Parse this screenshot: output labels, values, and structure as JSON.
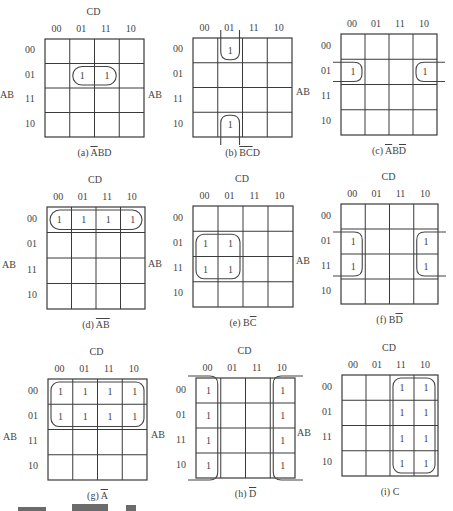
{
  "figure": {
    "row_variable": "AB",
    "col_variable": "CD",
    "gray_codes": [
      "00",
      "01",
      "11",
      "10"
    ],
    "maps": [
      {
        "id": "a",
        "caption_prefix": "(a) ",
        "caption_over": "A",
        "caption_rest": "BD",
        "show_cd": true,
        "grid": [
          45,
          39,
          99,
          98
        ],
        "ones": [
          [
            1,
            1
          ],
          [
            1,
            2
          ]
        ],
        "groups": [
          {
            "type": "rect",
            "rows": [
              1,
              1
            ],
            "cols": [
              1,
              2
            ]
          }
        ]
      },
      {
        "id": "b",
        "caption_prefix": "(b) ",
        "caption_over": "BC",
        "caption_rest": "D",
        "show_cd": false,
        "grid": [
          193,
          38,
          99,
          99
        ],
        "ones": [
          [
            0,
            1
          ],
          [
            3,
            1
          ]
        ],
        "groups": [
          {
            "type": "wrap-vertical",
            "rows": [
              0,
              3
            ],
            "cols": [
              1,
              1
            ]
          }
        ]
      },
      {
        "id": "c",
        "caption_prefix": "(c) ",
        "caption_over": "A",
        "caption_rest": "BD",
        "caption_tail_over": true,
        "show_cd": false,
        "grid": [
          341,
          34,
          96,
          101
        ],
        "ones": [
          [
            1,
            0
          ],
          [
            1,
            3
          ]
        ],
        "groups": [
          {
            "type": "wrap-horizontal",
            "rows": [
              1,
              1
            ],
            "cols": [
              0,
              3
            ]
          }
        ]
      },
      {
        "id": "d",
        "caption_prefix": "(d) ",
        "caption_over": "AB",
        "caption_rest": "",
        "show_cd": true,
        "grid": [
          47,
          207,
          98,
          102
        ],
        "ones": [
          [
            0,
            0
          ],
          [
            0,
            1
          ],
          [
            0,
            2
          ],
          [
            0,
            3
          ]
        ],
        "groups": [
          {
            "type": "rect",
            "rows": [
              0,
              0
            ],
            "cols": [
              0,
              3
            ]
          }
        ]
      },
      {
        "id": "e",
        "caption_prefix": "(e) B",
        "caption_over": "C",
        "caption_rest": "",
        "show_cd": true,
        "grid": [
          193,
          206,
          100,
          101
        ],
        "ones": [
          [
            1,
            0
          ],
          [
            1,
            1
          ],
          [
            2,
            0
          ],
          [
            2,
            1
          ]
        ],
        "groups": [
          {
            "type": "rect",
            "rows": [
              1,
              2
            ],
            "cols": [
              0,
              1
            ]
          }
        ]
      },
      {
        "id": "f",
        "caption_prefix": "(f) B",
        "caption_over": "D",
        "caption_rest": "",
        "show_cd": true,
        "grid": [
          341,
          204,
          97,
          100
        ],
        "ones": [
          [
            1,
            0
          ],
          [
            2,
            0
          ],
          [
            1,
            3
          ],
          [
            2,
            3
          ]
        ],
        "groups": [
          {
            "type": "wrap-horizontal",
            "rows": [
              1,
              2
            ],
            "cols": [
              0,
              3
            ]
          }
        ]
      },
      {
        "id": "g",
        "caption_prefix": "(g) ",
        "caption_over": "A",
        "caption_rest": "",
        "show_cd": true,
        "grid": [
          48,
          379,
          99,
          101
        ],
        "ones": [
          [
            0,
            0
          ],
          [
            0,
            1
          ],
          [
            0,
            2
          ],
          [
            0,
            3
          ],
          [
            1,
            0
          ],
          [
            1,
            1
          ],
          [
            1,
            2
          ],
          [
            1,
            3
          ]
        ],
        "groups": [
          {
            "type": "rect",
            "rows": [
              0,
              1
            ],
            "cols": [
              0,
              3
            ]
          }
        ]
      },
      {
        "id": "h",
        "caption_prefix": "(h) ",
        "caption_over": "D",
        "caption_rest": "",
        "show_cd": true,
        "grid": [
          196,
          378,
          99,
          100
        ],
        "ones": [
          [
            0,
            0
          ],
          [
            1,
            0
          ],
          [
            2,
            0
          ],
          [
            3,
            0
          ],
          [
            0,
            3
          ],
          [
            1,
            3
          ],
          [
            2,
            3
          ],
          [
            3,
            3
          ]
        ],
        "groups": [
          {
            "type": "wrap-horizontal",
            "rows": [
              0,
              3
            ],
            "cols": [
              0,
              3
            ]
          }
        ]
      },
      {
        "id": "i",
        "caption_prefix": "(i) C",
        "caption_over": "",
        "caption_rest": "",
        "show_cd": true,
        "grid": [
          342,
          375,
          96,
          101
        ],
        "ones": [
          [
            0,
            2
          ],
          [
            0,
            3
          ],
          [
            1,
            2
          ],
          [
            1,
            3
          ],
          [
            2,
            2
          ],
          [
            2,
            3
          ],
          [
            3,
            2
          ],
          [
            3,
            3
          ]
        ],
        "groups": [
          {
            "type": "rect",
            "rows": [
              0,
              3
            ],
            "cols": [
              2,
              3
            ]
          }
        ]
      }
    ],
    "cell_value": "1"
  }
}
